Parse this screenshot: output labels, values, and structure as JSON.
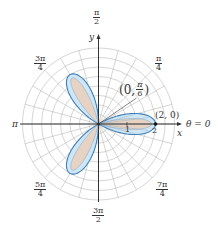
{
  "diagram": {
    "type": "polar-rose-plot",
    "equation_shape": "three-petal rose r = 2cos(3θ)",
    "colors": {
      "petal_fill": "#e6d3c3",
      "petal_outer_fill": "#cfe6f5",
      "petal_stroke": "#3d7fb8",
      "grid": "#b8b8b8",
      "axis": "#333333"
    },
    "angle_labels": [
      {
        "id": "pi_over_2",
        "num": "π",
        "den": "2"
      },
      {
        "id": "pi_over_4",
        "num": "π",
        "den": "4"
      },
      {
        "id": "three_pi_over_4",
        "num": "3π",
        "den": "4"
      },
      {
        "id": "pi",
        "text": "π"
      },
      {
        "id": "five_pi_over_4",
        "num": "5π",
        "den": "4"
      },
      {
        "id": "three_pi_over_2",
        "num": "3π",
        "den": "2"
      },
      {
        "id": "seven_pi_over_4",
        "num": "7π",
        "den": "4"
      }
    ],
    "axis_labels": {
      "x": "x",
      "y": "y",
      "theta_zero": "θ = 0"
    },
    "tick_labels": [
      "1",
      "2"
    ],
    "point_labels": {
      "tip": "(2, 0)",
      "zero_open": "(0,",
      "zero_num": "π",
      "zero_den": "6",
      "zero_close": ")"
    }
  }
}
